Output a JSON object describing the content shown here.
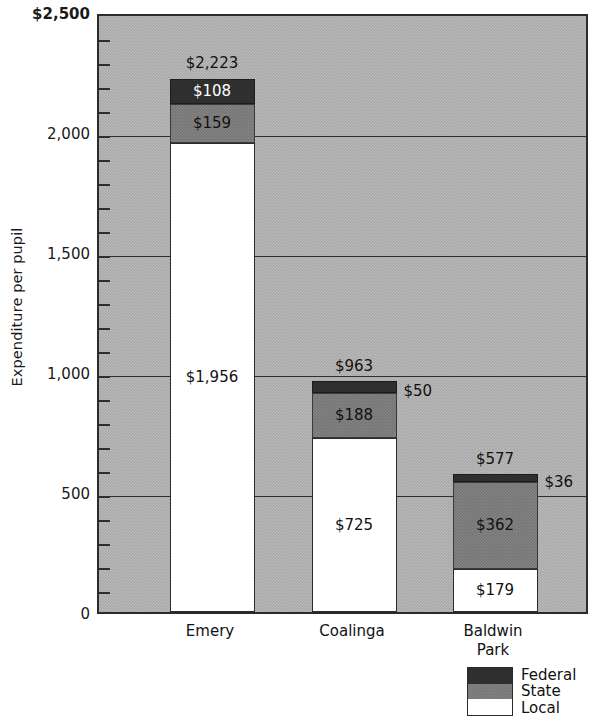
{
  "chart_data": {
    "type": "bar",
    "subtype": "stacked-bar",
    "title": "",
    "xlabel": "",
    "ylabel": "Expenditure per pupil",
    "ylim": [
      0,
      2500
    ],
    "y_tick_labels": [
      "$2,500",
      "2,000",
      "1,500",
      "1,000",
      "500",
      "0"
    ],
    "y_tick_values": [
      2500,
      2000,
      1500,
      1000,
      500,
      0
    ],
    "y_minor_tick_step": 100,
    "grid": "horizontal",
    "legend_position": "bottom-right",
    "categories": [
      "Emery",
      "Coalinga",
      "Baldwin Park"
    ],
    "series": [
      {
        "name": "Local",
        "values": [
          1956,
          725,
          179
        ],
        "color": "#ffffff"
      },
      {
        "name": "State",
        "values": [
          159,
          188,
          362
        ],
        "color": "#767676"
      },
      {
        "name": "Federal",
        "values": [
          108,
          50,
          36
        ],
        "color": "#2f2f2f"
      }
    ],
    "totals": [
      2223,
      963,
      577
    ],
    "data_labels": {
      "Emery": {
        "total": "$2,223",
        "federal": "$108",
        "state": "$159",
        "local": "$1,956"
      },
      "Coalinga": {
        "total": "$963",
        "federal": "$50",
        "state": "$188",
        "local": "$725"
      },
      "Baldwin Park": {
        "total": "$577",
        "federal": "$36",
        "state": "$362",
        "local": "$179"
      }
    },
    "plot_background_color": "#a8a8a8"
  },
  "axes": {
    "y_title": "Expenditure per pupil",
    "y_ticks": [
      {
        "label": "$2,500",
        "value": 2500
      },
      {
        "label": "2,000",
        "value": 2000
      },
      {
        "label": "1,500",
        "value": 1500
      },
      {
        "label": "1,000",
        "value": 1000
      },
      {
        "label": "500",
        "value": 500
      },
      {
        "label": "0",
        "value": 0
      }
    ],
    "x_categories": [
      {
        "line1": "Emery",
        "line2": ""
      },
      {
        "line1": "Coalinga",
        "line2": ""
      },
      {
        "line1": "Baldwin",
        "line2": "Park"
      }
    ]
  },
  "bars": [
    {
      "category": "Emery",
      "total_label": "$2,223",
      "segments": [
        {
          "name": "Federal",
          "label": "$108",
          "value": 108,
          "label_placement": "inside",
          "label_color": "light"
        },
        {
          "name": "State",
          "label": "$159",
          "value": 159,
          "label_placement": "inside",
          "label_color": "dark"
        },
        {
          "name": "Local",
          "label": "$1,956",
          "value": 1956,
          "label_placement": "inside",
          "label_color": "dark"
        }
      ]
    },
    {
      "category": "Coalinga",
      "total_label": "$963",
      "segments": [
        {
          "name": "Federal",
          "label": "$50",
          "value": 50,
          "label_placement": "right",
          "label_color": "dark"
        },
        {
          "name": "State",
          "label": "$188",
          "value": 188,
          "label_placement": "inside",
          "label_color": "dark"
        },
        {
          "name": "Local",
          "label": "$725",
          "value": 725,
          "label_placement": "inside",
          "label_color": "dark"
        }
      ]
    },
    {
      "category": "Baldwin Park",
      "total_label": "$577",
      "segments": [
        {
          "name": "Federal",
          "label": "$36",
          "value": 36,
          "label_placement": "right",
          "label_color": "dark"
        },
        {
          "name": "State",
          "label": "$362",
          "value": 362,
          "label_placement": "inside",
          "label_color": "dark"
        },
        {
          "name": "Local",
          "label": "$179",
          "value": 179,
          "label_placement": "inside",
          "label_color": "dark"
        }
      ]
    }
  ],
  "legend": {
    "items": [
      {
        "name": "Federal",
        "color": "#2f2f2f"
      },
      {
        "name": "State",
        "color": "#767676"
      },
      {
        "name": "Local",
        "color": "#ffffff"
      }
    ]
  }
}
